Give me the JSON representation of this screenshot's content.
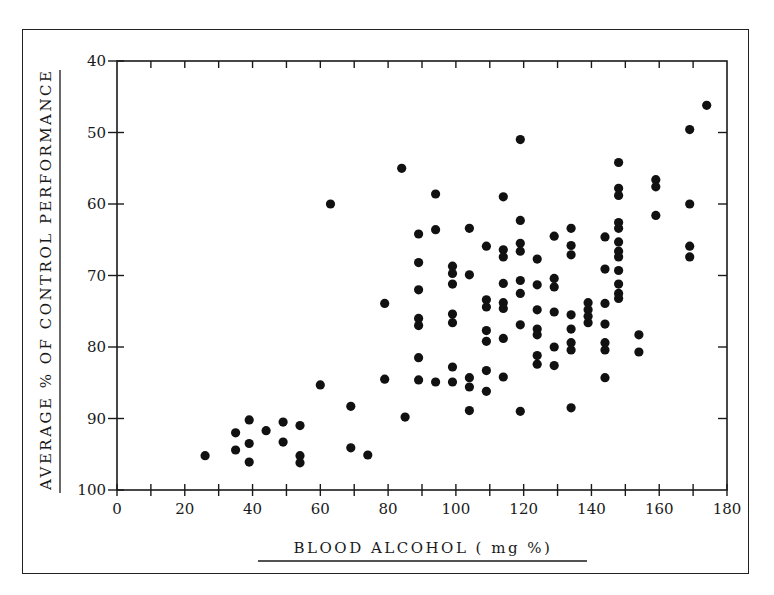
{
  "chart_data": {
    "type": "scatter",
    "title": "",
    "xlabel": "BLOOD ALCOHOL ( mg %)",
    "ylabel": "AVERAGE % OF CONTROL PERFORMANCE",
    "xlim": [
      0,
      180
    ],
    "ylim": [
      100,
      40
    ],
    "y_inverted": true,
    "grid": false,
    "legend": null,
    "x_ticks": [
      0,
      20,
      40,
      60,
      80,
      100,
      120,
      140,
      160,
      180
    ],
    "y_ticks": [
      40,
      50,
      60,
      70,
      80,
      90,
      100
    ],
    "x_minor_step": 10,
    "marker_color": "#111111",
    "series": [
      {
        "name": "subjects",
        "points": [
          [
            26,
            95.2
          ],
          [
            35,
            92.0
          ],
          [
            35,
            94.4
          ],
          [
            39,
            90.2
          ],
          [
            39,
            93.5
          ],
          [
            39,
            96.1
          ],
          [
            44,
            91.7
          ],
          [
            49,
            90.5
          ],
          [
            49,
            93.3
          ],
          [
            54,
            91.0
          ],
          [
            54,
            95.2
          ],
          [
            54,
            96.2
          ],
          [
            60,
            85.3
          ],
          [
            63,
            60.0
          ],
          [
            69,
            88.3
          ],
          [
            69,
            94.1
          ],
          [
            74,
            95.1
          ],
          [
            79,
            73.9
          ],
          [
            79,
            84.5
          ],
          [
            84,
            55.0
          ],
          [
            85,
            89.8
          ],
          [
            89,
            64.2
          ],
          [
            89,
            68.2
          ],
          [
            89,
            72.0
          ],
          [
            89,
            76.0
          ],
          [
            89,
            77.0
          ],
          [
            89,
            81.5
          ],
          [
            89,
            84.6
          ],
          [
            94,
            58.6
          ],
          [
            94,
            63.6
          ],
          [
            94,
            84.9
          ],
          [
            99,
            68.7
          ],
          [
            99,
            69.7
          ],
          [
            99,
            71.2
          ],
          [
            99,
            75.4
          ],
          [
            99,
            76.6
          ],
          [
            99,
            82.8
          ],
          [
            99,
            84.9
          ],
          [
            104,
            63.4
          ],
          [
            104,
            69.9
          ],
          [
            104,
            84.3
          ],
          [
            104,
            85.6
          ],
          [
            104,
            88.9
          ],
          [
            109,
            65.9
          ],
          [
            109,
            73.4
          ],
          [
            109,
            74.4
          ],
          [
            109,
            77.7
          ],
          [
            109,
            79.2
          ],
          [
            109,
            83.3
          ],
          [
            109,
            86.2
          ],
          [
            114,
            59.0
          ],
          [
            114,
            66.4
          ],
          [
            114,
            67.4
          ],
          [
            114,
            71.1
          ],
          [
            114,
            73.8
          ],
          [
            114,
            74.6
          ],
          [
            114,
            78.8
          ],
          [
            114,
            84.2
          ],
          [
            119,
            51.0
          ],
          [
            119,
            62.3
          ],
          [
            119,
            65.5
          ],
          [
            119,
            66.6
          ],
          [
            119,
            70.7
          ],
          [
            119,
            72.5
          ],
          [
            119,
            76.9
          ],
          [
            119,
            89.0
          ],
          [
            124,
            67.7
          ],
          [
            124,
            71.3
          ],
          [
            124,
            74.8
          ],
          [
            124,
            77.5
          ],
          [
            124,
            78.3
          ],
          [
            124,
            81.2
          ],
          [
            124,
            82.4
          ],
          [
            129,
            64.5
          ],
          [
            129,
            70.4
          ],
          [
            129,
            71.6
          ],
          [
            129,
            75.1
          ],
          [
            129,
            80.0
          ],
          [
            129,
            82.6
          ],
          [
            134,
            63.4
          ],
          [
            134,
            65.8
          ],
          [
            134,
            67.1
          ],
          [
            134,
            75.5
          ],
          [
            134,
            77.5
          ],
          [
            134,
            79.4
          ],
          [
            134,
            80.4
          ],
          [
            134,
            88.5
          ],
          [
            139,
            73.8
          ],
          [
            139,
            74.8
          ],
          [
            139,
            75.7
          ],
          [
            139,
            76.6
          ],
          [
            144,
            64.6
          ],
          [
            144,
            69.1
          ],
          [
            144,
            73.9
          ],
          [
            144,
            76.8
          ],
          [
            144,
            79.4
          ],
          [
            144,
            80.4
          ],
          [
            144,
            84.3
          ],
          [
            148,
            54.2
          ],
          [
            148,
            57.8
          ],
          [
            148,
            58.8
          ],
          [
            148,
            62.6
          ],
          [
            148,
            63.4
          ],
          [
            148,
            65.3
          ],
          [
            148,
            66.6
          ],
          [
            148,
            67.4
          ],
          [
            148,
            69.3
          ],
          [
            148,
            71.2
          ],
          [
            148,
            72.5
          ],
          [
            148,
            73.2
          ],
          [
            154,
            78.3
          ],
          [
            154,
            80.7
          ],
          [
            159,
            56.6
          ],
          [
            159,
            57.6
          ],
          [
            159,
            61.6
          ],
          [
            169,
            49.6
          ],
          [
            169,
            60.0
          ],
          [
            169,
            65.9
          ],
          [
            169,
            67.4
          ],
          [
            174,
            46.2
          ]
        ]
      }
    ]
  }
}
